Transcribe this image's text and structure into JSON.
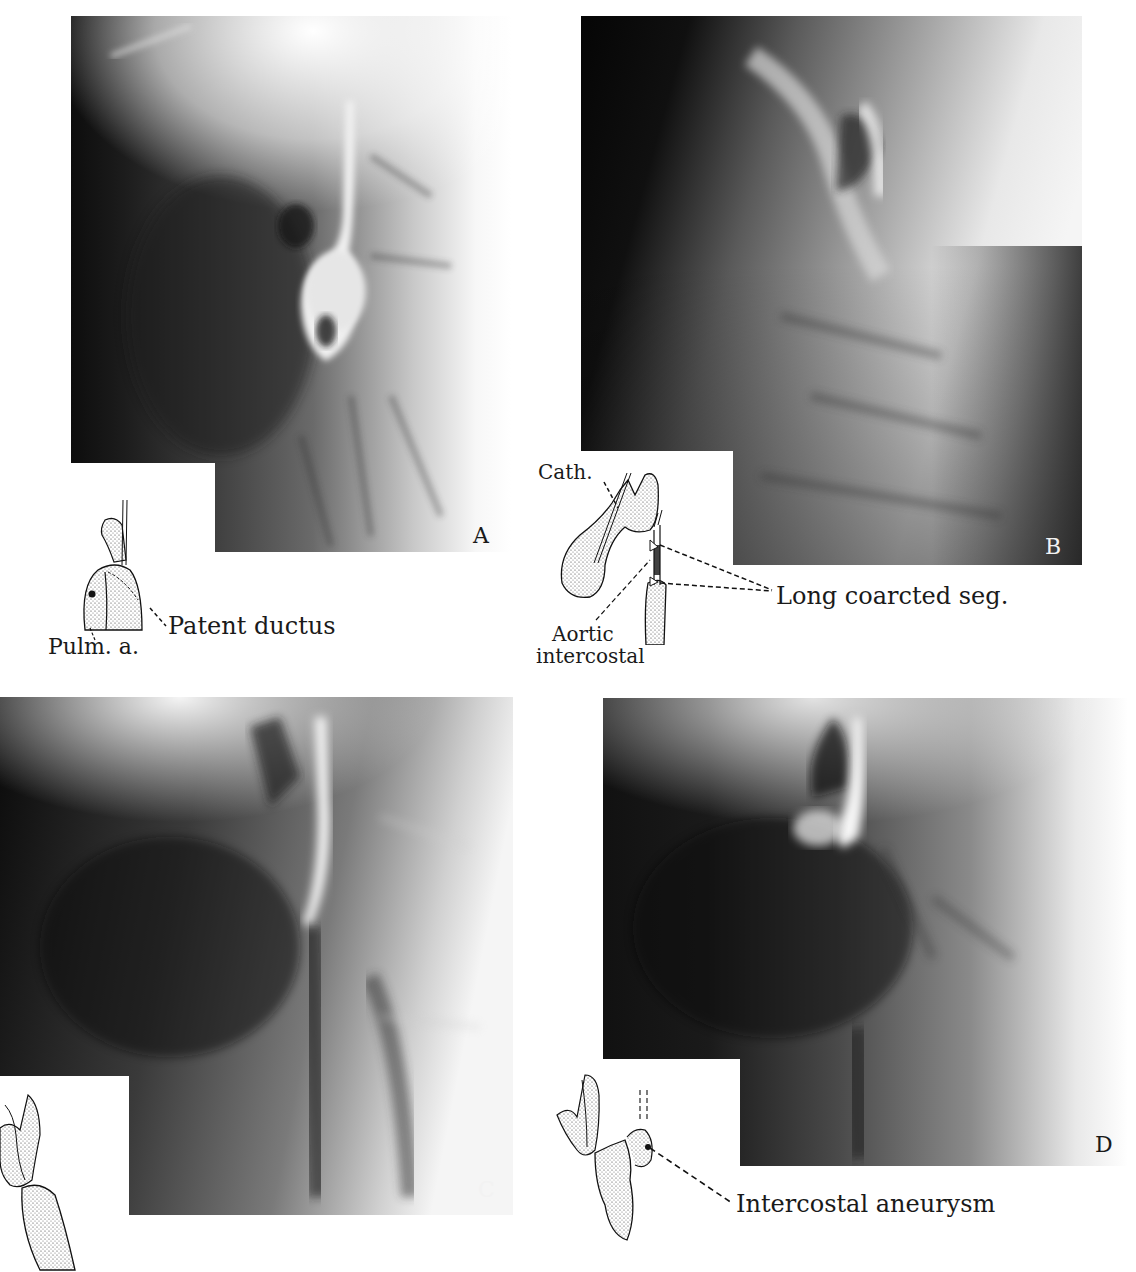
{
  "figure": {
    "panels": [
      {
        "id": "A",
        "letter": "A",
        "letter_color": "#1a1a1a"
      },
      {
        "id": "B",
        "letter": "B",
        "letter_color": "#f2f2f2"
      },
      {
        "id": "C",
        "letter": "C",
        "letter_color": "#f2f2f2"
      },
      {
        "id": "D",
        "letter": "D",
        "letter_color": "#1a1a1a"
      }
    ],
    "annotations": {
      "A": {
        "pulm": "Pulm. a.",
        "ductus": "Patent ductus"
      },
      "B": {
        "cath": "Cath.",
        "coarct": "Long coarcted seg.",
        "aortic_line1": "Aortic",
        "aortic_line2": "intercostal"
      },
      "D": {
        "aneurysm": "Intercostal aneurysm"
      }
    }
  }
}
